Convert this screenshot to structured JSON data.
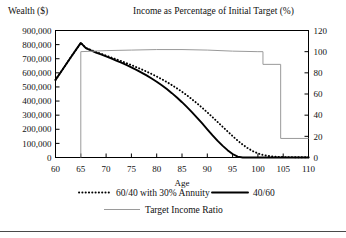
{
  "headers": {
    "left_axis_title": "Wealth ($)",
    "right_axis_title": "Income as Percentage of Initial Target (%)"
  },
  "chart_data": {
    "type": "line",
    "title": "",
    "xlabel": "Age",
    "ylabel": "Wealth ($)",
    "y2label": "Income as Percentage of Initial Target (%)",
    "xlim": [
      60,
      110
    ],
    "ylim": [
      0,
      900000
    ],
    "y2lim": [
      0,
      120
    ],
    "xticks": [
      60,
      65,
      70,
      75,
      80,
      85,
      90,
      95,
      100,
      105,
      110
    ],
    "xtick_labels": [
      "60",
      "65",
      "70",
      "75",
      "80",
      "85",
      "90",
      "95",
      "100",
      "105",
      "110"
    ],
    "yticks": [
      0,
      100000,
      200000,
      300000,
      400000,
      500000,
      600000,
      700000,
      800000,
      900000
    ],
    "ytick_labels": [
      "0",
      "100,000",
      "200,000",
      "300,000",
      "400,000",
      "500,000",
      "600,000",
      "700,000",
      "800,000",
      "900,000"
    ],
    "y2ticks": [
      0,
      20,
      40,
      60,
      80,
      100,
      120
    ],
    "y2tick_labels": [
      "0",
      "20",
      "40",
      "60",
      "80",
      "100",
      "120"
    ],
    "grid": false,
    "legend_position": "bottom",
    "series": [
      {
        "name": "60/40 with 30% Annuity",
        "style": "dotted",
        "color": "#000000",
        "axis": "left",
        "x": [
          60,
          61,
          62,
          63,
          64,
          65,
          66,
          67,
          68,
          69,
          70,
          71,
          72,
          73,
          74,
          75,
          76,
          77,
          78,
          79,
          80,
          81,
          82,
          83,
          84,
          85,
          86,
          87,
          88,
          89,
          90,
          91,
          92,
          93,
          94,
          95,
          96,
          97,
          98,
          99,
          100,
          101,
          102,
          103,
          104,
          105,
          106,
          107,
          108,
          109,
          110
        ],
        "values": [
          550000,
          603000,
          656000,
          709000,
          761000,
          812000,
          777000,
          762000,
          748000,
          735000,
          722000,
          709000,
          696000,
          683000,
          669000,
          655000,
          640000,
          625000,
          609000,
          592000,
          574000,
          555000,
          535000,
          513000,
          490000,
          466000,
          440000,
          412000,
          383000,
          352000,
          320000,
          287000,
          253000,
          219000,
          185000,
          152000,
          120000,
          91000,
          66000,
          45000,
          29000,
          18000,
          11000,
          7000,
          4500,
          3200,
          2600,
          2300,
          2100,
          2000,
          2000
        ]
      },
      {
        "name": "40/60",
        "style": "solid",
        "color": "#000000",
        "axis": "left",
        "x": [
          60,
          61,
          62,
          63,
          64,
          65,
          66,
          67,
          68,
          69,
          70,
          71,
          72,
          73,
          74,
          75,
          76,
          77,
          78,
          79,
          80,
          81,
          82,
          83,
          84,
          85,
          86,
          87,
          88,
          89,
          90,
          91,
          92,
          93,
          94,
          95,
          96,
          97,
          98,
          99,
          100,
          101,
          102,
          103,
          104,
          105,
          106,
          107,
          108,
          109,
          110
        ],
        "values": [
          550000,
          603000,
          656000,
          709000,
          761000,
          812000,
          775000,
          759000,
          744000,
          730000,
          716000,
          702000,
          687000,
          672000,
          656000,
          639000,
          621000,
          602000,
          582000,
          560000,
          537000,
          512000,
          485000,
          456000,
          425000,
          392000,
          357000,
          320000,
          281000,
          241000,
          200000,
          159000,
          120000,
          84000,
          52000,
          25000,
          6000,
          0,
          0,
          0,
          0,
          0,
          0,
          0,
          0,
          0,
          0,
          0,
          0,
          0,
          0
        ]
      },
      {
        "name": "Target Income Ratio",
        "style": "solid-gray",
        "color": "#9a9a9a",
        "axis": "right",
        "x": [
          65,
          65,
          70,
          75,
          80,
          85,
          90,
          95,
          100,
          101,
          101,
          104.5,
          104.5,
          110
        ],
        "values": [
          0,
          100,
          101,
          101.5,
          102,
          102,
          101.5,
          100.5,
          100,
          100,
          88,
          88,
          18,
          18
        ]
      }
    ],
    "legend": [
      {
        "label": "60/40 with 30% Annuity",
        "style": "dotted",
        "color": "#000000"
      },
      {
        "label": "40/60",
        "style": "solid",
        "color": "#000000"
      },
      {
        "label": "Target Income Ratio",
        "style": "solid-gray",
        "color": "#9a9a9a"
      }
    ]
  }
}
